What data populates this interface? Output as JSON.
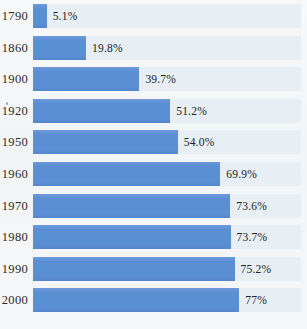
{
  "chart_data": {
    "type": "bar",
    "orientation": "horizontal",
    "title": "",
    "subtitle": "",
    "xlabel": "",
    "ylabel": "",
    "xlim": [
      0,
      100
    ],
    "grid": false,
    "legend": null,
    "categories": [
      "1790",
      "1860",
      "1900",
      "1920",
      "1950",
      "1960",
      "1970",
      "1980",
      "1990",
      "2000"
    ],
    "values": [
      5.1,
      19.8,
      39.7,
      51.2,
      54.0,
      69.9,
      73.6,
      73.7,
      75.2,
      77
    ],
    "value_labels": [
      "5.1%",
      "19.8%",
      "39.7%",
      "51.2%",
      "54.0%",
      "69.9%",
      "73.6%",
      "73.7%",
      "75.2%",
      "77%"
    ],
    "series": [
      {
        "name": "",
        "values": [
          5.1,
          19.8,
          39.7,
          51.2,
          54.0,
          69.9,
          73.6,
          73.7,
          75.2,
          77
        ]
      }
    ],
    "rows": [
      {
        "category": "1790",
        "value": 5.1,
        "label": "5.1%"
      },
      {
        "category": "1860",
        "value": 19.8,
        "label": "19.8%"
      },
      {
        "category": "1900",
        "value": 39.7,
        "label": "39.7%"
      },
      {
        "category": "1920",
        "value": 51.2,
        "label": "51.2%"
      },
      {
        "category": "1950",
        "value": 54.0,
        "label": "54.0%"
      },
      {
        "category": "1960",
        "value": 69.9,
        "label": "69.9%"
      },
      {
        "category": "1970",
        "value": 73.6,
        "label": "73.6%"
      },
      {
        "category": "1980",
        "value": 73.7,
        "label": "73.7%"
      },
      {
        "category": "1990",
        "value": 75.2,
        "label": "75.2%"
      },
      {
        "category": "2000",
        "value": 77,
        "label": "77%"
      }
    ]
  },
  "colors": {
    "bar": "#5b8fd4",
    "track": "#e7eff4",
    "background": "#f4f6f7",
    "label_text": "#2b2b2b",
    "value_text": "#222222"
  }
}
